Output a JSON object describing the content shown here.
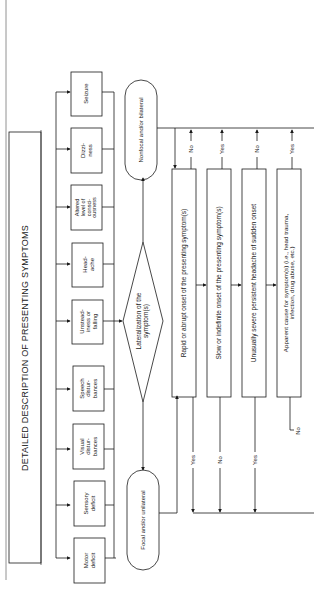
{
  "orientation": "rotated-90-ccw",
  "title": "DETAILED DESCRIPTION OF PRESENTING SYMPTOMS",
  "symptoms": [
    {
      "label": "Motor\ndeficit"
    },
    {
      "label": "Sensory\ndeficit"
    },
    {
      "label": "Visual\ndistur-\nbances"
    },
    {
      "label": "Speech\ndistur-\nbances"
    },
    {
      "label": "Unstead-\niness or\nfalling"
    },
    {
      "label": "Head-\nache"
    },
    {
      "label": "Altered\nlevel of\nconsci-\nousness"
    },
    {
      "label": "Dizzi-\nness"
    },
    {
      "label": "Seizure"
    }
  ],
  "decision": {
    "label": "Lateralization of the\nsymptom(s)"
  },
  "outcomes": {
    "focal": "Focal and/or unilateral",
    "nonfocal": "Nonfocal and/or bilateral"
  },
  "questions": [
    {
      "label": "Rapid or abrupt onset of the presenting symptom(s)",
      "left_answer": "Yes",
      "right_answer": "No"
    },
    {
      "label": "Slow or indefinite onset of the presenting symptom(s)",
      "left_answer": "No",
      "right_answer": "Yes"
    },
    {
      "label": "Unusually severe persistent headache of sudden onset",
      "left_answer": "Yes",
      "right_answer": "No"
    },
    {
      "label": "Apparent cause for symptom(s) (i.e., head trauma,\ninfection, drug abuse, etc.)",
      "left_answer": "No",
      "right_answer": "Yes"
    }
  ],
  "colors": {
    "line": "#1a1a1a",
    "background": "#ffffff"
  }
}
